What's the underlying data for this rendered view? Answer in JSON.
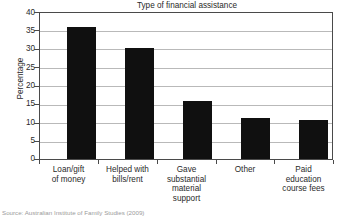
{
  "chart_data": {
    "type": "bar",
    "title": "Type of financial assistance",
    "xlabel": "",
    "ylabel": "Percentage",
    "ylim": [
      0,
      40
    ],
    "ytick_step": 5,
    "yticks": [
      "40",
      "35",
      "30",
      "25",
      "20",
      "15",
      "10",
      "5",
      "0"
    ],
    "grid": "horizontal",
    "legend": "none",
    "categories": [
      "Loan/gift of money",
      "Helped with bills/rent",
      "Gave substantial material support",
      "Other",
      "Paid education course fees"
    ],
    "values": [
      36.2,
      30.5,
      15.8,
      11.3,
      10.7
    ],
    "bar_color": "#101010"
  },
  "chart": {
    "title": "Type of financial assistance",
    "y_axis_label": "Percentage",
    "y_ticks": [
      {
        "label": "40",
        "value": 40
      },
      {
        "label": "35",
        "value": 35
      },
      {
        "label": "30",
        "value": 30
      },
      {
        "label": "25",
        "value": 25
      },
      {
        "label": "20",
        "value": 20
      },
      {
        "label": "15",
        "value": 15
      },
      {
        "label": "10",
        "value": 10
      },
      {
        "label": "5",
        "value": 5
      },
      {
        "label": "0",
        "value": 0
      }
    ],
    "bars": [
      {
        "label_line1": "Loan/gift",
        "label_line2": "of money",
        "label_line3": "",
        "label_line4": "",
        "value": 36.2
      },
      {
        "label_line1": "Helped with",
        "label_line2": "bills/rent",
        "label_line3": "",
        "label_line4": "",
        "value": 30.5
      },
      {
        "label_line1": "Gave",
        "label_line2": "substantial",
        "label_line3": "material",
        "label_line4": "support",
        "value": 15.8
      },
      {
        "label_line1": "Other",
        "label_line2": "",
        "label_line3": "",
        "label_line4": "",
        "value": 11.3
      },
      {
        "label_line1": "Paid",
        "label_line2": "education",
        "label_line3": "course fees",
        "label_line4": "",
        "value": 10.7
      }
    ]
  },
  "footer": {
    "source_note": "Source: Australian Institute of Family Studies (2009)"
  }
}
